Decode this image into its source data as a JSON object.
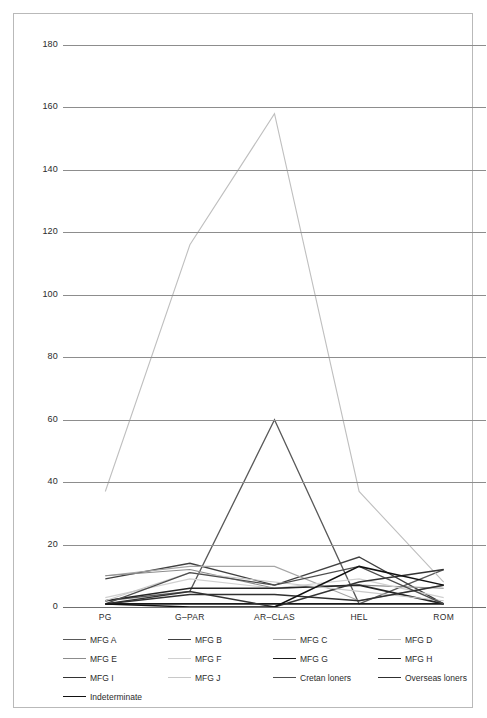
{
  "chart_data": {
    "type": "line",
    "title": "",
    "subtitle": "",
    "xlabel": "",
    "ylabel": "",
    "categories": [
      "PG",
      "G–PAR",
      "AR–CLAS",
      "HEL",
      "ROM"
    ],
    "ylim": [
      0,
      180
    ],
    "ytick_interval": 20,
    "yticks": [
      "0",
      "20",
      "40",
      "60",
      "80",
      "100",
      "120",
      "140",
      "160",
      "180"
    ],
    "grid": "horizontal",
    "legend_position": "bottom",
    "series": [
      {
        "name": "MFG A",
        "color": "#595959",
        "width": 1.3,
        "values": [
          2,
          5,
          60,
          1,
          12
        ]
      },
      {
        "name": "MFG B",
        "color": "#404040",
        "width": 1.3,
        "values": [
          9,
          14,
          7,
          16,
          1
        ]
      },
      {
        "name": "MFG C",
        "color": "#a6a6a6",
        "width": 1.1,
        "values": [
          10,
          13,
          13,
          2,
          7
        ]
      },
      {
        "name": "MFG D",
        "color": "#bfbfbf",
        "width": 1.1,
        "values": [
          37,
          116,
          158,
          37,
          8
        ]
      },
      {
        "name": "MFG E",
        "color": "#8c8c8c",
        "width": 1.1,
        "values": [
          10,
          12,
          6,
          7,
          6
        ]
      },
      {
        "name": "MFG F",
        "color": "#d0d0d0",
        "width": 1.1,
        "values": [
          3,
          9,
          6,
          9,
          3
        ]
      },
      {
        "name": "MFG G",
        "color": "#1a1a1a",
        "width": 1.6,
        "values": [
          1,
          1,
          1,
          1,
          1
        ]
      },
      {
        "name": "MFG H",
        "color": "#262626",
        "width": 1.6,
        "values": [
          2,
          6,
          6,
          7,
          1
        ]
      },
      {
        "name": "MFG I",
        "color": "#333333",
        "width": 1.5,
        "values": [
          1,
          5,
          0,
          8,
          12
        ]
      },
      {
        "name": "MFG J",
        "color": "#c8c8c8",
        "width": 1.1,
        "values": [
          2,
          11,
          8,
          5,
          2
        ]
      },
      {
        "name": "Cretan loners",
        "color": "#4d4d4d",
        "width": 1.4,
        "values": [
          1,
          11,
          7,
          13,
          1
        ]
      },
      {
        "name": "Overseas loners",
        "color": "#303030",
        "width": 1.5,
        "values": [
          1,
          4,
          4,
          2,
          7
        ]
      },
      {
        "name": "Indeterminate",
        "color": "#111111",
        "width": 1.5,
        "values": [
          1,
          0,
          0,
          13,
          7
        ]
      }
    ]
  },
  "legend": {
    "items": [
      {
        "label": "MFG A"
      },
      {
        "label": "MFG B"
      },
      {
        "label": "MFG C"
      },
      {
        "label": "MFG D"
      },
      {
        "label": "MFG E"
      },
      {
        "label": "MFG F"
      },
      {
        "label": "MFG G"
      },
      {
        "label": "MFG H"
      },
      {
        "label": "MFG I"
      },
      {
        "label": "MFG J"
      },
      {
        "label": "Cretan loners"
      },
      {
        "label": "Overseas loners"
      },
      {
        "label": "Indeterminate"
      }
    ]
  },
  "style": {
    "gridline_color": "#8d8d8d",
    "frame_color": "#b9b9b9",
    "text_color": "#2b2b2b",
    "background": "#ffffff"
  }
}
